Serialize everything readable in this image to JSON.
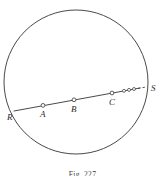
{
  "figure": {
    "caption": "Fig. 227",
    "stroke_color": "#4a4a4a",
    "label_color": "#2b2b2b",
    "background_color": "#ffffff",
    "circle": {
      "name": "circle",
      "cx": 76,
      "cy": 82,
      "r": 72,
      "stroke_width": 1
    },
    "secant": {
      "name": "secant-line",
      "x1": 14,
      "y1": 111,
      "x2": 143,
      "y2": 88,
      "stroke_width": 1
    },
    "points": [
      {
        "id": "R",
        "label": "R",
        "x": 16.5,
        "y": 110.2,
        "marker": false,
        "label_x": 7,
        "label_y": 120
      },
      {
        "id": "A",
        "label": "A",
        "x": 43,
        "y": 105.4,
        "marker": true,
        "label_x": 40,
        "label_y": 117
      },
      {
        "id": "B",
        "label": "B",
        "x": 74,
        "y": 99.8,
        "marker": true,
        "label_x": 71,
        "label_y": 112
      },
      {
        "id": "C",
        "label": "C",
        "x": 112,
        "y": 93.0,
        "marker": true,
        "label_x": 109,
        "label_y": 105
      },
      {
        "id": "S",
        "label": "S",
        "x": 146,
        "y": 87.0,
        "marker": false,
        "label_x": 152,
        "label_y": 91
      }
    ],
    "ellipsis_dots": [
      {
        "x": 124,
        "y": 90.8,
        "r": 1.5
      },
      {
        "x": 129,
        "y": 89.9,
        "r": 1.5
      },
      {
        "x": 134,
        "y": 89.0,
        "r": 1.5
      }
    ],
    "dash_segment": {
      "x1": 138,
      "y1": 88.4,
      "x2": 144.5,
      "y2": 87.2
    },
    "marker_radius": 1.9
  }
}
